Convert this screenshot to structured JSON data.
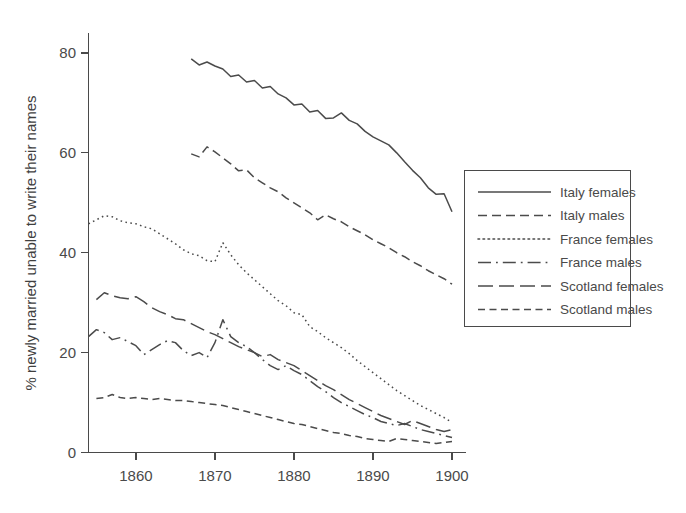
{
  "chart_data": {
    "type": "line",
    "title": "",
    "xlabel": "",
    "ylabel": "% newly married unable to write their names",
    "xlim": [
      1854,
      1900
    ],
    "ylim": [
      0,
      84
    ],
    "grid": false,
    "legend_position": "right",
    "x_ticks": [
      1860,
      1870,
      1880,
      1890,
      1900
    ],
    "y_ticks": [
      0,
      20,
      40,
      60,
      80
    ],
    "series": [
      {
        "name": "Italy females",
        "style": "solid",
        "x": [
          1867,
          1868,
          1869,
          1870,
          1871,
          1872,
          1873,
          1874,
          1875,
          1876,
          1877,
          1878,
          1879,
          1880,
          1881,
          1882,
          1883,
          1884,
          1885,
          1886,
          1887,
          1888,
          1889,
          1890,
          1891,
          1892,
          1893,
          1894,
          1895,
          1896,
          1897,
          1898,
          1899,
          1900
        ],
        "values": [
          78.8,
          77.6,
          78.2,
          77.4,
          76.8,
          75.3,
          75.6,
          74.2,
          74.5,
          73.0,
          73.3,
          71.8,
          71.0,
          69.6,
          69.8,
          68.2,
          68.5,
          66.9,
          67.0,
          68.0,
          66.5,
          65.8,
          64.3,
          63.2,
          62.4,
          61.6,
          60.0,
          58.2,
          56.5,
          55.0,
          53.0,
          51.7,
          51.8,
          48.2
        ]
      },
      {
        "name": "Italy males",
        "style": "dashed",
        "x": [
          1867,
          1868,
          1869,
          1870,
          1871,
          1872,
          1873,
          1874,
          1875,
          1876,
          1877,
          1878,
          1879,
          1880,
          1881,
          1882,
          1883,
          1884,
          1885,
          1886,
          1887,
          1888,
          1889,
          1890,
          1891,
          1892,
          1893,
          1894,
          1895,
          1896,
          1897,
          1898,
          1899,
          1900
        ],
        "values": [
          59.8,
          59.2,
          61.2,
          60.2,
          59.0,
          57.8,
          56.4,
          56.6,
          55.0,
          54.0,
          53.0,
          52.2,
          51.0,
          50.0,
          49.0,
          48.0,
          46.6,
          47.6,
          46.8,
          46.2,
          45.2,
          44.4,
          43.6,
          42.6,
          41.8,
          41.0,
          40.0,
          39.2,
          38.2,
          37.4,
          36.4,
          35.6,
          34.8,
          33.7
        ]
      },
      {
        "name": "France females",
        "style": "dotted",
        "x": [
          1854,
          1855,
          1856,
          1857,
          1858,
          1859,
          1860,
          1861,
          1862,
          1863,
          1864,
          1865,
          1866,
          1867,
          1868,
          1869,
          1870,
          1871,
          1872,
          1873,
          1874,
          1875,
          1876,
          1877,
          1878,
          1879,
          1880,
          1881,
          1882,
          1883,
          1884,
          1885,
          1886,
          1887,
          1888,
          1889,
          1890,
          1891,
          1892,
          1893,
          1894,
          1895,
          1896,
          1897,
          1898,
          1899,
          1900
        ],
        "values": [
          45.8,
          46.6,
          47.4,
          47.2,
          46.4,
          46.0,
          45.8,
          45.2,
          44.8,
          43.8,
          42.8,
          41.8,
          40.6,
          39.8,
          39.4,
          38.4,
          38.2,
          42.0,
          39.6,
          37.6,
          36.0,
          34.6,
          33.2,
          31.8,
          30.4,
          29.4,
          28.0,
          27.6,
          25.2,
          24.2,
          23.0,
          22.0,
          21.0,
          19.8,
          18.4,
          17.2,
          16.0,
          14.8,
          13.6,
          12.4,
          11.4,
          10.4,
          9.4,
          8.6,
          7.8,
          7.0,
          6.0
        ]
      },
      {
        "name": "France males",
        "style": "dashdot-long",
        "x": [
          1854,
          1855,
          1856,
          1857,
          1858,
          1859,
          1860,
          1861,
          1862,
          1863,
          1864,
          1865,
          1866,
          1867,
          1868,
          1869,
          1870,
          1871,
          1872,
          1873,
          1874,
          1875,
          1876,
          1877,
          1878,
          1879,
          1880,
          1881,
          1882,
          1883,
          1884,
          1885,
          1886,
          1887,
          1888,
          1889,
          1890,
          1891,
          1892,
          1893,
          1894,
          1895,
          1896,
          1897,
          1898,
          1899,
          1900
        ],
        "values": [
          23.2,
          24.6,
          24.0,
          22.6,
          23.0,
          22.2,
          21.4,
          19.6,
          20.6,
          21.6,
          22.4,
          22.0,
          20.4,
          19.4,
          20.0,
          19.0,
          22.0,
          26.6,
          23.2,
          22.0,
          21.2,
          20.0,
          18.6,
          17.4,
          16.6,
          17.4,
          16.4,
          15.6,
          14.4,
          13.2,
          12.2,
          11.0,
          10.0,
          9.2,
          8.4,
          7.6,
          7.0,
          6.2,
          5.8,
          5.4,
          5.8,
          5.2,
          4.6,
          4.2,
          3.8,
          3.4,
          3.0
        ]
      },
      {
        "name": "Scotland females",
        "style": "longdash",
        "x": [
          1855,
          1856,
          1857,
          1858,
          1859,
          1860,
          1861,
          1862,
          1863,
          1864,
          1865,
          1866,
          1867,
          1868,
          1869,
          1870,
          1871,
          1872,
          1873,
          1874,
          1875,
          1876,
          1877,
          1878,
          1879,
          1880,
          1881,
          1882,
          1883,
          1884,
          1885,
          1886,
          1887,
          1888,
          1889,
          1890,
          1891,
          1892,
          1893,
          1894,
          1895,
          1896,
          1897,
          1898,
          1899,
          1900
        ],
        "values": [
          30.6,
          32.0,
          31.4,
          31.0,
          30.8,
          31.2,
          30.2,
          29.0,
          28.2,
          27.6,
          26.8,
          26.6,
          25.8,
          25.0,
          24.2,
          23.6,
          22.8,
          22.0,
          21.2,
          20.6,
          20.0,
          19.2,
          19.6,
          18.6,
          18.0,
          17.4,
          16.4,
          15.4,
          14.4,
          13.4,
          12.6,
          11.6,
          10.6,
          9.8,
          9.0,
          8.2,
          7.4,
          6.8,
          6.2,
          5.6,
          6.4,
          5.8,
          5.2,
          4.6,
          4.2,
          4.6
        ]
      },
      {
        "name": "Scotland males",
        "style": "dash-short",
        "x": [
          1855,
          1856,
          1857,
          1858,
          1859,
          1860,
          1861,
          1862,
          1863,
          1864,
          1865,
          1866,
          1867,
          1868,
          1869,
          1870,
          1871,
          1872,
          1873,
          1874,
          1875,
          1876,
          1877,
          1878,
          1879,
          1880,
          1881,
          1882,
          1883,
          1884,
          1885,
          1886,
          1887,
          1888,
          1889,
          1890,
          1891,
          1892,
          1893,
          1894,
          1895,
          1896,
          1897,
          1898,
          1899,
          1900
        ],
        "values": [
          10.8,
          11.0,
          11.6,
          11.0,
          10.8,
          11.0,
          10.8,
          10.6,
          10.8,
          10.6,
          10.4,
          10.4,
          10.2,
          10.0,
          9.8,
          9.6,
          9.4,
          9.0,
          8.6,
          8.2,
          7.8,
          7.4,
          7.0,
          6.6,
          6.2,
          5.8,
          5.6,
          5.2,
          4.8,
          4.4,
          4.0,
          3.8,
          3.4,
          3.2,
          2.8,
          2.6,
          2.4,
          2.2,
          2.8,
          2.6,
          2.4,
          2.2,
          2.0,
          1.8,
          2.0,
          2.2
        ]
      }
    ]
  },
  "legend": {
    "items": [
      {
        "label": "Italy females",
        "style": "solid"
      },
      {
        "label": "Italy males",
        "style": "dashed"
      },
      {
        "label": "France females",
        "style": "dotted"
      },
      {
        "label": "France males",
        "style": "dashdot-long"
      },
      {
        "label": "Scotland females",
        "style": "longdash"
      },
      {
        "label": "Scotland males",
        "style": "dash-short"
      }
    ]
  },
  "colors": {
    "ink": "#4b4b4b",
    "axis": "#4a4a4a",
    "background": "#ffffff"
  }
}
